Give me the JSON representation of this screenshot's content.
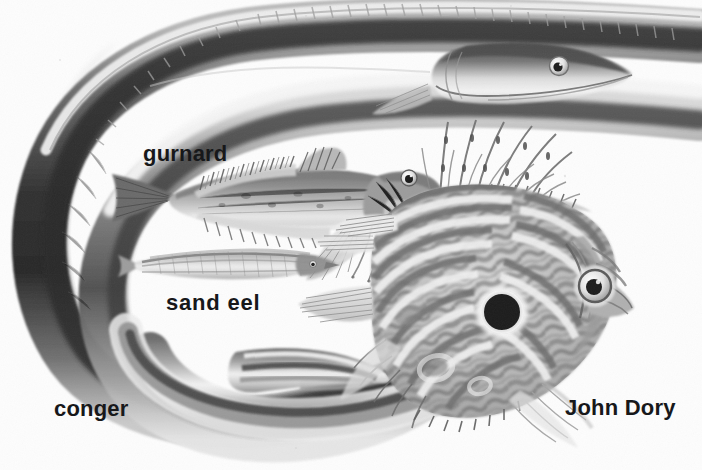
{
  "image": {
    "kind": "grayscale-natural-history-illustration",
    "subject": "sea fishes plate",
    "width": 702,
    "height": 470,
    "background_color": "#fdfdfd",
    "ink_color": "#17181a"
  },
  "labels": {
    "gurnard": "gurnard",
    "sand_eel": "sand eel",
    "conger": "conger",
    "john_dory": "John Dory"
  },
  "specimens": [
    {
      "id": "conger",
      "label": "conger",
      "description": "long eel curved into a wide U-shape around the left side of the plate, head at upper right, tail tapering at lower centre"
    },
    {
      "id": "gurnard",
      "label": "gurnard",
      "description": "mid-sized spiny fish in the centre with armoured head, banded dorsal fins and free pectoral rays, facing right"
    },
    {
      "id": "sand-eel",
      "label": "sand eel",
      "description": "slender pale needle-shaped fish below the gurnard, facing right"
    },
    {
      "id": "john-dory",
      "label": "John Dory",
      "description": "deep oval fish at lower right with long trailing dorsal spines and a large dark round spot on its flank"
    }
  ]
}
